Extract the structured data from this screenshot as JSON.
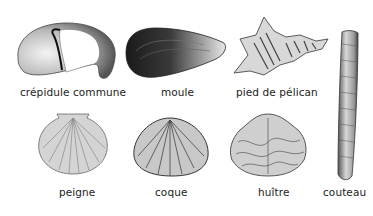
{
  "shells": [
    {
      "id": "crepidule",
      "label": "crépidule commune"
    },
    {
      "id": "moule",
      "label": "moule"
    },
    {
      "id": "pied-de-pelican",
      "label": "pied de pélican"
    },
    {
      "id": "couteau",
      "label": "couteau"
    },
    {
      "id": "peigne",
      "label": "peigne"
    },
    {
      "id": "coque",
      "label": "coque"
    },
    {
      "id": "huitre",
      "label": "huître"
    }
  ],
  "colors": {
    "background": "#ffffff",
    "ink": "#222222"
  }
}
